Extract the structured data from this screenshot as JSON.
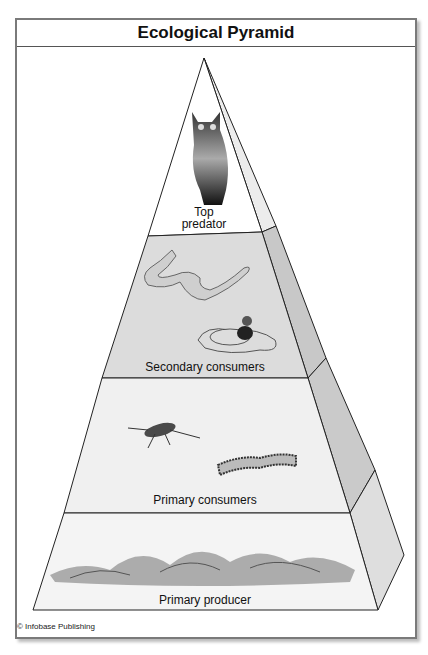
{
  "title": "Ecological Pyramid",
  "tiers": [
    {
      "label": "Top predator",
      "label_line1": "Top",
      "label_line2": "predator",
      "organisms": [
        "owl"
      ]
    },
    {
      "label": "Secondary consumers",
      "organisms": [
        "snake",
        "duck"
      ]
    },
    {
      "label": "Primary consumers",
      "organisms": [
        "cricket",
        "caterpillar"
      ]
    },
    {
      "label": "Primary producer",
      "organisms": [
        "grass"
      ]
    }
  ],
  "credit": "© Infobase Publishing",
  "colors": {
    "top_tier": "#ffffff",
    "secondary_tier": "#dcdcdc",
    "primary_tier": "#f0f0f0",
    "producer_tier": "#f4f4f4",
    "side_face": "#cfcfcf",
    "outline": "#222222"
  }
}
